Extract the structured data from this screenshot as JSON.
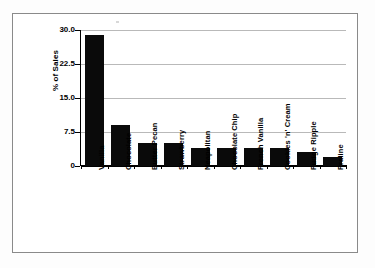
{
  "chart_data": {
    "type": "bar",
    "title": "",
    "xlabel": "",
    "ylabel": "% of Sales",
    "categories": [
      "Vanilla",
      "Chocolate",
      "Butter Pecan",
      "Strawberry",
      "Neapolitan",
      "Chocolate Chip",
      "French Vanilla",
      "Cookies 'n' Cream",
      "Fudge Ripple",
      "Praline"
    ],
    "values": [
      29.0,
      9.0,
      5.0,
      5.0,
      4.0,
      4.0,
      4.0,
      4.0,
      3.0,
      2.0
    ],
    "ylim": [
      0,
      30
    ],
    "yticks": [
      0,
      7.5,
      15.0,
      22.5,
      30.0
    ],
    "ytick_labels": [
      "0",
      "7.5",
      "15.0",
      "22.5",
      "30.0"
    ],
    "grid": true,
    "legend": false,
    "legend_position": "none",
    "bar_color": "#0a0a0a",
    "grid_color": "#b9b9b9",
    "axis_color": "#000000",
    "background_color": "#ffffff",
    "frame_color": "#8a8a8a"
  }
}
